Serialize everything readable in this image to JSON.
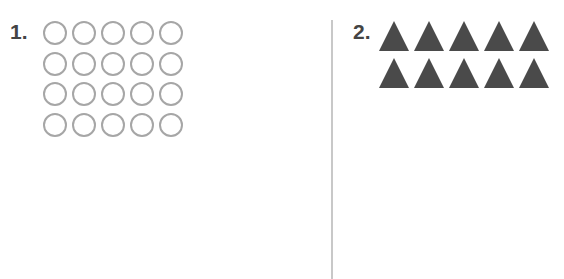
{
  "problems": [
    {
      "number": "1.",
      "shape": "circle-outline",
      "rows": 4,
      "columns": 5,
      "count": 20,
      "color": "#a6a6a6"
    },
    {
      "number": "2.",
      "shape": "triangle-filled",
      "rows": 2,
      "columns": 5,
      "count": 10,
      "color": "#4a4a4a"
    }
  ]
}
